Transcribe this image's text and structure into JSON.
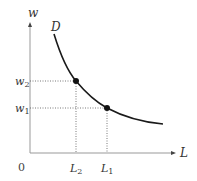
{
  "diagram": {
    "type": "labor demand curve",
    "y_axis_label": "w",
    "x_axis_label": "L",
    "origin_label": "0",
    "curve_label": "D",
    "wage_levels": [
      {
        "label": "w",
        "sub": "2"
      },
      {
        "label": "w",
        "sub": "1"
      }
    ],
    "labor_levels": [
      {
        "label": "L",
        "sub": "2"
      },
      {
        "label": "L",
        "sub": "1"
      }
    ],
    "points": [
      {
        "name": "point-w2-L2",
        "w": "w2",
        "L": "L2"
      },
      {
        "name": "point-w1-L1",
        "w": "w1",
        "L": "L1"
      }
    ],
    "colors": {
      "axis": "#888888",
      "curve": "#1a1a1a",
      "guide": "#555555"
    }
  }
}
